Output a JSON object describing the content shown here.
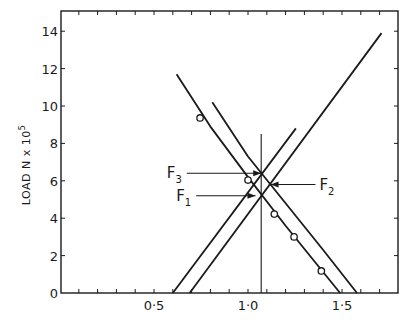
{
  "chart_data": {
    "type": "line",
    "title": "",
    "xlabel": "",
    "ylabel": "LOAD  N x 10^5",
    "ylabel_parts": {
      "main": "LOAD  N x 10",
      "sup": "5"
    },
    "xlim": [
      0,
      1.8
    ],
    "ylim": [
      0,
      15
    ],
    "grid": false,
    "x_ticks": [
      {
        "value": 0.5,
        "label": "0·5"
      },
      {
        "value": 1.0,
        "label": "1·0"
      },
      {
        "value": 1.5,
        "label": "1·5"
      }
    ],
    "x_minor_step": 0.1,
    "y_ticks": [
      {
        "value": 0,
        "label": "0"
      },
      {
        "value": 2,
        "label": "2"
      },
      {
        "value": 4,
        "label": "4"
      },
      {
        "value": 6,
        "label": "6"
      },
      {
        "value": 8,
        "label": "8"
      },
      {
        "value": 10,
        "label": "10"
      },
      {
        "value": 12,
        "label": "12"
      },
      {
        "value": 14,
        "label": "14"
      }
    ],
    "series": [
      {
        "name": "rising-line-1",
        "style": "line",
        "points": [
          [
            0.6,
            0
          ],
          [
            1.255,
            8.8
          ]
        ]
      },
      {
        "name": "rising-line-2",
        "style": "line",
        "points": [
          [
            0.69,
            0
          ],
          [
            1.71,
            13.9
          ]
        ]
      },
      {
        "name": "falling-curve-1",
        "style": "line",
        "points": [
          [
            0.62,
            11.7
          ],
          [
            0.8,
            8.9
          ],
          [
            1.0,
            6.2
          ],
          [
            1.2,
            3.6
          ],
          [
            1.49,
            0
          ]
        ]
      },
      {
        "name": "falling-curve-2",
        "style": "line",
        "points": [
          [
            0.81,
            10.2
          ],
          [
            1.0,
            7.3
          ],
          [
            1.2,
            4.8
          ],
          [
            1.4,
            2.3
          ],
          [
            1.58,
            0
          ]
        ]
      },
      {
        "name": "measured-points",
        "style": "scatter",
        "points": [
          [
            0.745,
            9.36
          ],
          [
            1.0,
            6.04
          ],
          [
            1.14,
            4.22
          ],
          [
            1.245,
            3.0
          ],
          [
            1.39,
            1.18
          ]
        ]
      },
      {
        "name": "vertical-reference",
        "style": "line",
        "points": [
          [
            1.07,
            0
          ],
          [
            1.07,
            8.5
          ]
        ]
      }
    ],
    "annotations": [
      {
        "label": "F",
        "sub": "3",
        "text": "F3",
        "target": [
          1.07,
          6.4
        ],
        "label_pos": [
          0.6,
          6.4
        ]
      },
      {
        "label": "F",
        "sub": "1",
        "text": "F1",
        "target": [
          1.04,
          5.2
        ],
        "label_pos": [
          0.65,
          5.2
        ]
      },
      {
        "label": "F",
        "sub": "2",
        "text": "F2",
        "target": [
          1.12,
          5.8
        ],
        "label_pos": [
          1.38,
          5.8
        ]
      }
    ]
  }
}
